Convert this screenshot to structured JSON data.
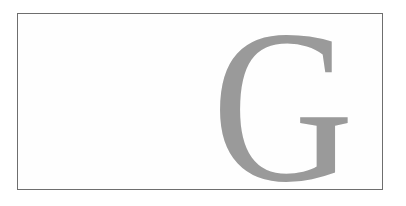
{
  "document": {
    "drop_cap": {
      "letter": "G",
      "color": "#9a9a9a"
    },
    "border_color": "#6e6e6e"
  }
}
